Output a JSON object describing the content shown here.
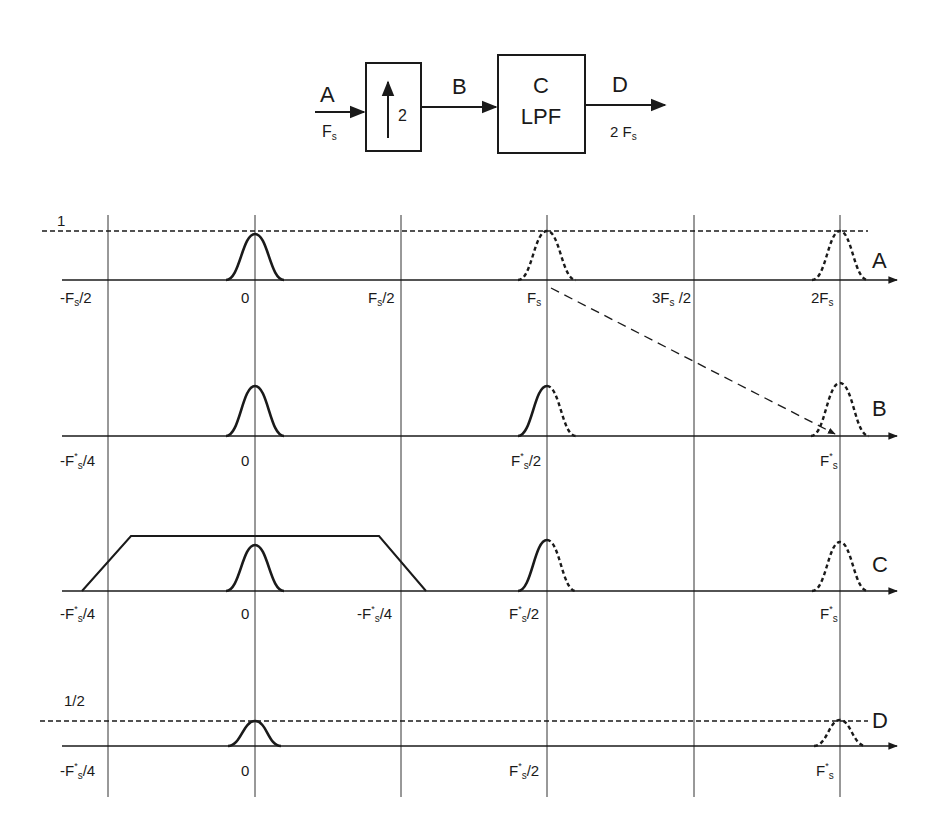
{
  "block_diagram": {
    "input_label": "A",
    "input_rate": "F",
    "input_rate_sub": "s",
    "upsampler_symbol": "↑",
    "upsampler_factor": "2",
    "mid_label": "B",
    "filter_letter": "C",
    "filter_label": "LPF",
    "output_label": "D",
    "output_rate": "2 F",
    "output_rate_sub": "s"
  },
  "spectra": {
    "amplitude_one": "1",
    "amplitude_half": "1/2",
    "rows": [
      {
        "name": "A",
        "ticks": [
          {
            "main": "-F",
            "sup": "",
            "sub": "s",
            "tail": "/2"
          },
          {
            "main": "0",
            "sup": "",
            "sub": "",
            "tail": ""
          },
          {
            "main": "F",
            "sup": "",
            "sub": "s",
            "tail": "/2"
          },
          {
            "main": "F",
            "sup": "",
            "sub": "s",
            "tail": ""
          },
          {
            "main": "3F",
            "sup": "",
            "sub": "s",
            "tail": " /2"
          },
          {
            "main": "2F",
            "sup": "",
            "sub": "s",
            "tail": ""
          }
        ]
      },
      {
        "name": "B",
        "ticks": [
          {
            "main": "-F",
            "sup": "*",
            "sub": "s",
            "tail": "/4"
          },
          {
            "main": "0",
            "sup": "",
            "sub": "",
            "tail": ""
          },
          {
            "main": "F",
            "sup": "*",
            "sub": "s",
            "tail": "/2"
          },
          {
            "main": "F",
            "sup": "*",
            "sub": "s",
            "tail": ""
          }
        ]
      },
      {
        "name": "C",
        "ticks": [
          {
            "main": "-F",
            "sup": "*",
            "sub": "s",
            "tail": "/4"
          },
          {
            "main": "0",
            "sup": "",
            "sub": "",
            "tail": ""
          },
          {
            "main": "-F",
            "sup": "*",
            "sub": "s",
            "tail": "/4"
          },
          {
            "main": "F",
            "sup": "*",
            "sub": "s",
            "tail": "/2"
          },
          {
            "main": "F",
            "sup": "*",
            "sub": "s",
            "tail": ""
          }
        ]
      },
      {
        "name": "D",
        "ticks": [
          {
            "main": "-F",
            "sup": "*",
            "sub": "s",
            "tail": "/4"
          },
          {
            "main": "0",
            "sup": "",
            "sub": "",
            "tail": ""
          },
          {
            "main": "F",
            "sup": "*",
            "sub": "s",
            "tail": "/2"
          },
          {
            "main": "F",
            "sup": "*",
            "sub": "s",
            "tail": ""
          }
        ]
      }
    ]
  }
}
